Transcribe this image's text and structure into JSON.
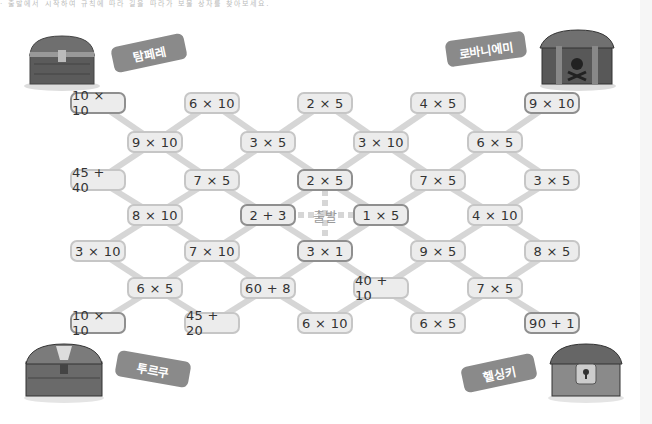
{
  "header_text": "· 출발에서 시작하여 규칙에 따라 길을 따라가 보물 상자를 찾아보세요.",
  "start_label": "출발",
  "treasures": [
    {
      "name": "탐페레",
      "pos": "top-left"
    },
    {
      "name": "로바니에미",
      "pos": "top-right"
    },
    {
      "name": "투르쿠",
      "pos": "bottom-left"
    },
    {
      "name": "헬싱키",
      "pos": "bottom-right"
    }
  ],
  "cells": [
    {
      "id": "c0",
      "text": "10 × 10",
      "x": 98,
      "y": 103,
      "hl": true
    },
    {
      "id": "c1",
      "text": "6 × 10",
      "x": 212,
      "y": 103
    },
    {
      "id": "c2",
      "text": "2 × 5",
      "x": 325,
      "y": 103
    },
    {
      "id": "c3",
      "text": "4 × 5",
      "x": 438,
      "y": 103
    },
    {
      "id": "c4",
      "text": "9 × 10",
      "x": 552,
      "y": 103,
      "hl": true
    },
    {
      "id": "c5",
      "text": "9 × 10",
      "x": 155,
      "y": 142
    },
    {
      "id": "c6",
      "text": "3 × 5",
      "x": 268,
      "y": 142
    },
    {
      "id": "c7",
      "text": "3 × 10",
      "x": 381,
      "y": 142
    },
    {
      "id": "c8",
      "text": "6 × 5",
      "x": 495,
      "y": 142
    },
    {
      "id": "c9",
      "text": "45 + 40",
      "x": 98,
      "y": 180
    },
    {
      "id": "c10",
      "text": "7 × 5",
      "x": 212,
      "y": 180
    },
    {
      "id": "c11",
      "text": "2 × 5",
      "x": 325,
      "y": 180,
      "hl": true
    },
    {
      "id": "c12",
      "text": "7 × 5",
      "x": 438,
      "y": 180
    },
    {
      "id": "c13",
      "text": "3 × 5",
      "x": 552,
      "y": 180
    },
    {
      "id": "c14",
      "text": "8 × 10",
      "x": 155,
      "y": 215
    },
    {
      "id": "c15",
      "text": "2 + 3",
      "x": 268,
      "y": 215,
      "hl": true
    },
    {
      "id": "c16",
      "text": "1 × 5",
      "x": 381,
      "y": 215,
      "hl": true
    },
    {
      "id": "c17",
      "text": "4 × 10",
      "x": 495,
      "y": 215
    },
    {
      "id": "c18",
      "text": "3 × 10",
      "x": 98,
      "y": 251
    },
    {
      "id": "c19",
      "text": "7 × 10",
      "x": 212,
      "y": 251
    },
    {
      "id": "c20",
      "text": "3 × 1",
      "x": 325,
      "y": 251,
      "hl": true
    },
    {
      "id": "c21",
      "text": "9 × 5",
      "x": 438,
      "y": 251
    },
    {
      "id": "c22",
      "text": "8 × 5",
      "x": 552,
      "y": 251
    },
    {
      "id": "c23",
      "text": "6 × 5",
      "x": 155,
      "y": 288
    },
    {
      "id": "c24",
      "text": "60 + 8",
      "x": 268,
      "y": 288
    },
    {
      "id": "c25",
      "text": "40 + 10",
      "x": 381,
      "y": 288
    },
    {
      "id": "c26",
      "text": "7 × 5",
      "x": 495,
      "y": 288
    },
    {
      "id": "c27",
      "text": "10 × 10",
      "x": 98,
      "y": 323,
      "hl": true
    },
    {
      "id": "c28",
      "text": "45 + 20",
      "x": 212,
      "y": 323
    },
    {
      "id": "c29",
      "text": "6 × 10",
      "x": 325,
      "y": 323
    },
    {
      "id": "c30",
      "text": "6 × 5",
      "x": 438,
      "y": 323
    },
    {
      "id": "c31",
      "text": "90 + 1",
      "x": 552,
      "y": 323,
      "hl": true
    }
  ],
  "colors": {
    "link": "#d6d6d6",
    "cell_bg": "#ececec",
    "cell_border": "#c6c6c6",
    "highlight_border": "#8f8f8f",
    "tag": "#8a8a8a"
  }
}
